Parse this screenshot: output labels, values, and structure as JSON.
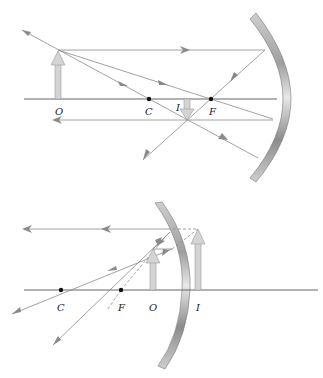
{
  "figures": [
    {
      "id": "concave-mirror",
      "description": "Ray diagram, concave mirror, object beyond center of curvature",
      "labels": {
        "object": "O",
        "center": "C",
        "image": "I",
        "focal": "F"
      }
    },
    {
      "id": "convex-side-mirror",
      "description": "Ray diagram, object between focal point and mirror, virtual upright image",
      "labels": {
        "center": "C",
        "focal": "F",
        "object": "O",
        "image": "I"
      }
    }
  ],
  "colors": {
    "ray": "#8a8a8a",
    "axis": "#555555",
    "arrow_fill": "#d4d4d4",
    "arrow_stroke": "#9a9a9a",
    "point": "#111111"
  }
}
